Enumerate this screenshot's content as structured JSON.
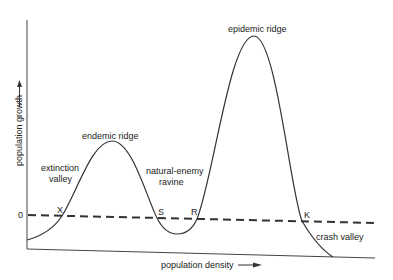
{
  "diagram": {
    "axes": {
      "x_label": "population density",
      "y_label": "population growth",
      "zero_label": "0"
    },
    "regions": {
      "extinction_valley_line1": "extinction",
      "extinction_valley_line2": "valley",
      "endemic_ridge": "endemic  ridge",
      "natural_enemy_ravine_line1": "natural-enemy",
      "natural_enemy_ravine_line2": "ravine",
      "epidemic_ridge": "epidemic ridge",
      "crash_valley": "crash valley"
    },
    "points": {
      "X": "X",
      "S": "S",
      "R": "R",
      "K": "K"
    },
    "colors": {
      "line": "#333333",
      "background": "#ffffff"
    }
  }
}
